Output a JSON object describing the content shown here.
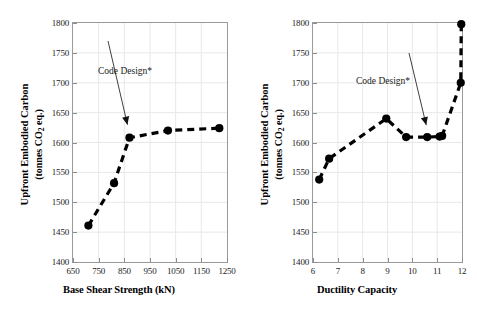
{
  "figure": {
    "background": "#ffffff",
    "axis_color": "#9a9a9a",
    "grid_color": "#e8e8e8",
    "series_color": "#000000",
    "annotation_color": "#1a1a1a"
  },
  "chart_data": [
    {
      "type": "line",
      "panel": "left",
      "title": "",
      "xlabel": "Base Shear Strength (kN)",
      "ylabel": "Upfront Embodied Carbon (tonnes CO2 eq.)",
      "ylabel_line1": "Upfront Embodied Carbon",
      "ylabel_line2_prefix": "(tonnes CO",
      "ylabel_line2_sub": "2",
      "ylabel_line2_suffix": " eq.)",
      "xlim": [
        650,
        1250
      ],
      "ylim": [
        1400,
        1800
      ],
      "xticks": [
        650,
        750,
        850,
        950,
        1050,
        1150,
        1250
      ],
      "yticks": [
        1400,
        1450,
        1500,
        1550,
        1600,
        1650,
        1700,
        1750,
        1800
      ],
      "grid": true,
      "legend": "none",
      "line_style": "dashed",
      "marker": "filled-circle",
      "x": [
        710,
        810,
        870,
        1020,
        1220
      ],
      "y": [
        1461,
        1532,
        1608,
        1620,
        1624
      ],
      "annotations": [
        {
          "text": "Code Design*",
          "points_to_x": 870,
          "points_to_y": 1608
        }
      ]
    },
    {
      "type": "line",
      "panel": "right",
      "title": "",
      "xlabel": "Ductility Capacity",
      "ylabel": "Upfront Embodied Carbon (tonnes CO2 eq.)",
      "ylabel_line1": "Upfront Embodied Carbon",
      "ylabel_line2_prefix": "(tonnes CO",
      "ylabel_line2_sub": "2",
      "ylabel_line2_suffix": " eq.)",
      "xlim": [
        6,
        12
      ],
      "ylim": [
        1400,
        1800
      ],
      "xticks": [
        6,
        7,
        8,
        9,
        10,
        11,
        12
      ],
      "yticks": [
        1400,
        1450,
        1500,
        1550,
        1600,
        1650,
        1700,
        1750,
        1800
      ],
      "grid": true,
      "legend": "none",
      "line_style": "dashed",
      "marker": "filled-circle",
      "x": [
        6.25,
        6.65,
        8.95,
        9.75,
        10.6,
        11.1,
        11.2,
        11.95,
        11.97
      ],
      "y": [
        1538,
        1573,
        1640,
        1609,
        1609,
        1610,
        1611,
        1700,
        1798
      ],
      "annotations": [
        {
          "text": "Code Design*",
          "points_to_x": 10.6,
          "points_to_y": 1609
        }
      ]
    }
  ]
}
